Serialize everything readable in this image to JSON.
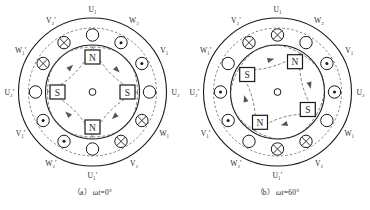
{
  "figure": {
    "slot_count": 12,
    "pole_count": 4,
    "symbols": {
      "into_page": "⊗",
      "out_of_page": "⊙",
      "zero_current": "○",
      "north_pole": "N",
      "south_pole": "S"
    }
  },
  "panels": [
    {
      "id": "a",
      "caption_index": "（a）",
      "caption_text": "ωt=0°",
      "caption_omega": "ωt",
      "caption_value": "=0°",
      "center_label": "",
      "slots": [
        {
          "label": "U₁",
          "angle_deg": 0,
          "current": "zero_current"
        },
        {
          "label": "W₂",
          "angle_deg": 30,
          "current": "out_of_page"
        },
        {
          "label": "V₁",
          "angle_deg": 60,
          "current": "out_of_page"
        },
        {
          "label": "U₂",
          "angle_deg": 90,
          "current": "zero_current"
        },
        {
          "label": "W₁",
          "angle_deg": 120,
          "current": "into_page"
        },
        {
          "label": "V₂",
          "angle_deg": 150,
          "current": "into_page"
        },
        {
          "label": "U₁′",
          "angle_deg": 180,
          "current": "zero_current"
        },
        {
          "label": "W₂′",
          "angle_deg": 210,
          "current": "out_of_page"
        },
        {
          "label": "V₁′",
          "angle_deg": 240,
          "current": "out_of_page"
        },
        {
          "label": "U₂′",
          "angle_deg": 270,
          "current": "zero_current"
        },
        {
          "label": "W₁′",
          "angle_deg": 300,
          "current": "into_page"
        },
        {
          "label": "V₂′",
          "angle_deg": 330,
          "current": "into_page"
        }
      ],
      "poles": [
        {
          "label": "N",
          "angle_deg": 0
        },
        {
          "label": "S",
          "angle_deg": 90
        },
        {
          "label": "N",
          "angle_deg": 180
        },
        {
          "label": "S",
          "angle_deg": 270
        }
      ],
      "flux_arrow_angles_deg": [
        45,
        135,
        225,
        315
      ]
    },
    {
      "id": "b",
      "caption_index": "（b）",
      "caption_text": "ωt=60°",
      "caption_omega": "ωt",
      "caption_value": "=60°",
      "center_label": "",
      "slots": [
        {
          "label": "U₁",
          "angle_deg": 0,
          "current": "into_page"
        },
        {
          "label": "W₂",
          "angle_deg": 30,
          "current": "zero_current"
        },
        {
          "label": "V₁",
          "angle_deg": 60,
          "current": "out_of_page"
        },
        {
          "label": "U₂",
          "angle_deg": 90,
          "current": "out_of_page"
        },
        {
          "label": "W₁",
          "angle_deg": 120,
          "current": "zero_current"
        },
        {
          "label": "V₂",
          "angle_deg": 150,
          "current": "into_page"
        },
        {
          "label": "U₁′",
          "angle_deg": 180,
          "current": "into_page"
        },
        {
          "label": "W₂′",
          "angle_deg": 210,
          "current": "zero_current"
        },
        {
          "label": "V₁′",
          "angle_deg": 240,
          "current": "out_of_page"
        },
        {
          "label": "U₂′",
          "angle_deg": 270,
          "current": "out_of_page"
        },
        {
          "label": "W₁′",
          "angle_deg": 300,
          "current": "zero_current"
        },
        {
          "label": "V₂′",
          "angle_deg": 330,
          "current": "into_page"
        }
      ],
      "poles": [
        {
          "label": "N",
          "angle_deg": 30
        },
        {
          "label": "S",
          "angle_deg": 120
        },
        {
          "label": "N",
          "angle_deg": 210
        },
        {
          "label": "S",
          "angle_deg": 300
        }
      ],
      "flux_arrow_angles_deg": [
        75,
        165,
        255,
        345
      ]
    }
  ],
  "colors": {
    "line": "#1a1a1a",
    "dashed": "#555555",
    "text": "#2b2b2b",
    "background": "#ffffff"
  }
}
